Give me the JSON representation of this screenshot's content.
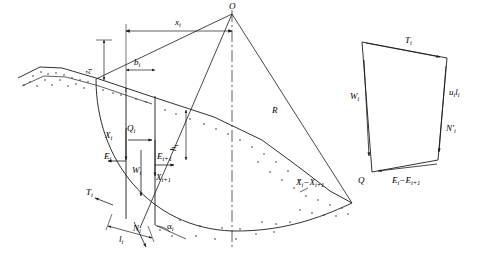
{
  "figure": {
    "panels": [
      {
        "name": "slope-slice-panel",
        "description": "Slope with circular slip surface, slice i forces"
      },
      {
        "name": "force-polygon-panel",
        "description": "Force polygon for slice i"
      }
    ]
  },
  "labels": {
    "center_O": "O",
    "radius_R": "R",
    "x_i": "x",
    "x_i_sub": "i",
    "b_i": "b",
    "b_i_sub": "i",
    "z_i": "z",
    "z_i_sub": "i",
    "h_i": "h",
    "h_i_sub": "i",
    "Q_i": "Q",
    "Q_i_sub": "i",
    "W_i": "W",
    "W_i_sub": "i",
    "X_i": "X",
    "X_i_sub": "i",
    "E_i": "E",
    "E_i_sub": "i",
    "X_i1": "X",
    "X_i1_sub": "i+1",
    "E_i1": "E",
    "E_i1_sub": "i+1",
    "T_i": "T",
    "T_i_sub": "i",
    "N_i": "N",
    "N_i_sub": "i",
    "l_i": "l",
    "l_i_sub": "i",
    "alpha_i": "α",
    "alpha_i_sub": "i",
    "Xi_minus_Xi1": "X",
    "Xi_minus_Xi1_sub1": "i",
    "Xi_minus_Xi1_mid": "−X",
    "Xi_minus_Xi1_sub2": "i+1",
    "poly_T_i": "T",
    "poly_T_i_sub": "i",
    "poly_W_i": "W",
    "poly_W_i_sub": "i",
    "poly_u_l": "u",
    "poly_u_l_sub1": "i",
    "poly_u_l_mid": "l",
    "poly_u_l_sub2": "i",
    "poly_N_prime": "N",
    "poly_N_prime_mark": "′",
    "poly_N_prime_sub": "i",
    "poly_Q": "Q",
    "poly_E_diff": "E",
    "poly_E_diff_sub1": "i",
    "poly_E_diff_mid": "−E",
    "poly_E_diff_sub2": "i+1"
  },
  "colors": {
    "stroke": "#1a1a1a",
    "fill": "#ffffff",
    "soil_dots": "#333333"
  }
}
